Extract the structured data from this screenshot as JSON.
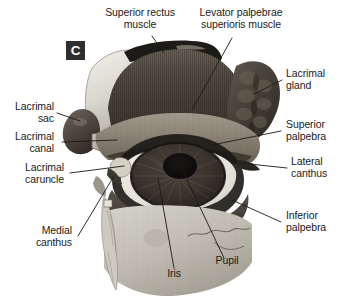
{
  "figure": {
    "panel_tag": "C",
    "background_color": "#ffffff",
    "text_color": "#1b1b1b",
    "leader_line_color": "#1a1a1a",
    "panel_tag_bg": "#2e2e2e",
    "panel_tag_fg": "#ffffff"
  },
  "labels": {
    "superior_rectus": "Superior rectus\nmuscle",
    "levator": "Levator palpebrae\nsuperioris muscle",
    "lacrimal_gland": "Lacrimal\ngland",
    "superior_palpebra": "Superior\npalpebra",
    "lateral_canthus": "Lateral\ncanthus",
    "inferior_palpebra": "Inferior\npalpebra",
    "lacrimal_sac": "Lacrimal\nsac",
    "lacrimal_canal": "Lacrimal\ncanal",
    "lacrimal_caruncle": "Lacrimal\ncaruncle",
    "medial_canthus": "Medial\ncanthus",
    "iris": "Iris",
    "pupil": "Pupil"
  }
}
